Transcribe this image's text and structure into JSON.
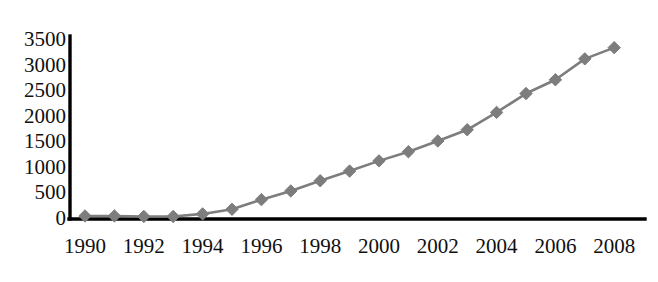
{
  "chart_data": {
    "type": "line",
    "title": "",
    "subtitle": "",
    "xlabel": "",
    "ylabel": "",
    "legend": [],
    "legend_position": "none",
    "grid": false,
    "marker": "diamond",
    "series_color": "#7d7d7d",
    "axis_color": "#000000",
    "xlim": [
      1989.5,
      2008.8
    ],
    "ylim": [
      0,
      3500
    ],
    "ytick_values": [
      0,
      500,
      1000,
      1500,
      2000,
      2500,
      3000,
      3500
    ],
    "ytick_labels": [
      "0",
      "500",
      "1000",
      "1500",
      "2000",
      "2500",
      "3000",
      "3500"
    ],
    "xtick_values": [
      1990,
      1992,
      1994,
      1996,
      1998,
      2000,
      2002,
      2004,
      2006,
      2008
    ],
    "xtick_labels": [
      "1990",
      "1992",
      "1994",
      "1996",
      "1998",
      "2000",
      "2002",
      "2004",
      "2006",
      "2008"
    ],
    "x": [
      1990,
      1991,
      1992,
      1993,
      1994,
      1995,
      1996,
      1997,
      1998,
      1999,
      2000,
      2001,
      2002,
      2003,
      2004,
      2005,
      2006,
      2007,
      2008
    ],
    "values": [
      50,
      50,
      40,
      40,
      90,
      180,
      370,
      540,
      740,
      930,
      1130,
      1310,
      1520,
      1740,
      2080,
      2450,
      2720,
      3130,
      3350
    ],
    "series": [
      {
        "name": "series-1",
        "values": [
          50,
          50,
          40,
          40,
          90,
          180,
          370,
          540,
          740,
          930,
          1130,
          1310,
          1520,
          1740,
          2080,
          2450,
          2720,
          3130,
          3350
        ]
      }
    ]
  }
}
